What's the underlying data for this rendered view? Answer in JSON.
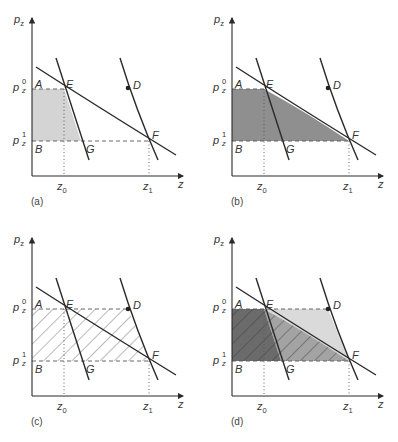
{
  "figure": {
    "axis_labels": {
      "y": "p",
      "y_sub": "z",
      "x": "z"
    },
    "price_labels": {
      "p0_base": "p",
      "p0_sup": "0",
      "p0_sub": "z",
      "p1_base": "p",
      "p1_sup": "1",
      "p1_sub": "z"
    },
    "quantity_labels": {
      "z0_base": "z",
      "z0_sub": "0",
      "z1_base": "z",
      "z1_sub": "1"
    },
    "points": {
      "A": "A",
      "B": "B",
      "D": "D",
      "E": "E",
      "F": "F",
      "G": "G"
    },
    "panels": [
      {
        "id": "a",
        "label": "(a)",
        "shading": "light gray trapezoid A-E-G-B"
      },
      {
        "id": "b",
        "label": "(b)",
        "shading": "gray region A-E-F-B under demand curve"
      },
      {
        "id": "c",
        "label": "(c)",
        "shading": "hatched quadrilateral A-D-F-B"
      },
      {
        "id": "d",
        "label": "(d)",
        "shading": "dark A-E-G-B, medium E-G-F, light E-D-F, hatching over A-E-F-B"
      }
    ],
    "colors": {
      "line": "#2a2a2a",
      "fill_a": "#d4d4d4",
      "fill_b": "#8f8f8f",
      "fill_d_dark": "#6b6b6b",
      "fill_d_mid": "#a3a3a3",
      "fill_d_light": "#dadada",
      "hatch": "#555555"
    }
  }
}
